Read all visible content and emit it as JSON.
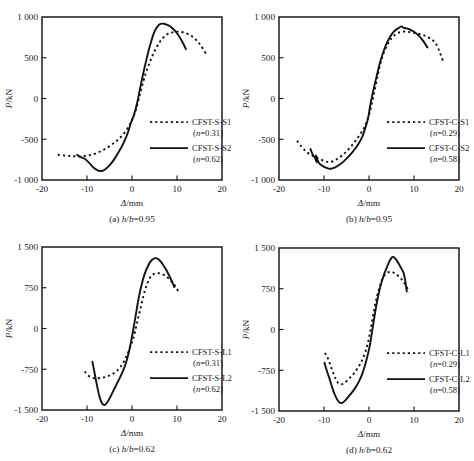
{
  "figure": {
    "panel_count": 4,
    "bottom_caption": ""
  },
  "axes": {
    "xlabel": "Δ/mm",
    "ylabel": "P/kN",
    "xticks": [
      "-20",
      "-10",
      "0",
      "10",
      "20"
    ],
    "xtick_values": [
      -20,
      -10,
      0,
      10,
      20
    ],
    "yticks_top": [
      "1 000",
      "500",
      "0",
      "-500",
      "-1 000"
    ],
    "ytick_values_top": [
      1000,
      500,
      0,
      -500,
      -1000
    ],
    "yticks_bottom": [
      "1 500",
      "750",
      "0",
      "-750",
      "-1 500"
    ],
    "ytick_values_bottom": [
      1500,
      750,
      0,
      -750,
      -1500
    ]
  },
  "panels": [
    {
      "id": "a",
      "caption_index": "(a)",
      "caption_param": "h/b",
      "caption_value": "0.95",
      "caption_full": "(a)  h/b=0.95",
      "legend": [
        {
          "name": "CFST-S-S1",
          "sub": "(n=0.31)",
          "style": "dashed"
        },
        {
          "name": "CFST-S-S2",
          "sub": "(n=0.62)",
          "style": "solid"
        }
      ]
    },
    {
      "id": "b",
      "caption_index": "(b)",
      "caption_param": "h/b",
      "caption_value": "0.95",
      "caption_full": "(b)  h/b=0.95",
      "legend": [
        {
          "name": "CFST-C-S1",
          "sub": "(n=0.29)",
          "style": "dashed"
        },
        {
          "name": "CFST-C-S2",
          "sub": "(n=0.58)",
          "style": "solid"
        }
      ]
    },
    {
      "id": "c",
      "caption_index": "(c)",
      "caption_param": "h/b",
      "caption_value": "0.62",
      "caption_full": "(c)  h/b=0.62",
      "legend": [
        {
          "name": "CFST-S-L1",
          "sub": "(n=0.31)",
          "style": "dashed"
        },
        {
          "name": "CFST-S-L2",
          "sub": "(n=0.62)",
          "style": "solid"
        }
      ]
    },
    {
      "id": "d",
      "caption_index": "(d)",
      "caption_param": "h/b",
      "caption_value": "0.62",
      "caption_full": "(d)  h/b=0.62",
      "legend": [
        {
          "name": "CFST-C-L1",
          "sub": "(n=0.29)",
          "style": "dashed"
        },
        {
          "name": "CFST-C-L2",
          "sub": "(n=0.58)",
          "style": "solid"
        }
      ]
    }
  ],
  "chart_data": [
    {
      "type": "line",
      "panel": "a",
      "title": "(a) h/b=0.95",
      "xlabel": "Δ/mm",
      "ylabel": "P/kN",
      "xlim": [
        -20,
        20
      ],
      "ylim": [
        -1000,
        1000
      ],
      "grid": false,
      "legend_position": "inside-right",
      "series": [
        {
          "name": "CFST-S-S1",
          "annotation": "(n=0.31)",
          "style": "dashed",
          "x": [
            -16.5,
            -15.0,
            -13.5,
            -12.0,
            -10.5,
            -9.0,
            -7.5,
            -6.0,
            -4.5,
            -3.0,
            -1.5,
            -0.5,
            0.0,
            0.8,
            1.8,
            3.0,
            4.5,
            6.0,
            7.5,
            9.0,
            10.5,
            12.0,
            13.5,
            15.0,
            16.5
          ],
          "y": [
            -690,
            -700,
            -706,
            -712,
            -706,
            -690,
            -660,
            -620,
            -566,
            -500,
            -410,
            -320,
            -260,
            -150,
            60,
            300,
            520,
            680,
            775,
            812,
            820,
            800,
            755,
            672,
            545
          ]
        },
        {
          "name": "CFST-S-S2",
          "annotation": "(n=0.62)",
          "style": "solid",
          "x": [
            -12.2,
            -11.5,
            -10.5,
            -9.5,
            -8.5,
            -7.5,
            -6.8,
            -6.0,
            -5.0,
            -4.0,
            -3.0,
            -2.0,
            -1.0,
            -0.3,
            0.0,
            0.5,
            1.2,
            2.0,
            3.0,
            4.0,
            5.0,
            6.0,
            7.0,
            8.0,
            9.0,
            10.0,
            11.0,
            12.0
          ],
          "y": [
            -690,
            -716,
            -740,
            -790,
            -850,
            -885,
            -890,
            -870,
            -820,
            -750,
            -660,
            -560,
            -430,
            -310,
            -265,
            -190,
            -40,
            180,
            430,
            650,
            820,
            905,
            918,
            900,
            862,
            800,
            715,
            605
          ]
        }
      ]
    },
    {
      "type": "line",
      "panel": "b",
      "title": "(b) h/b=0.95",
      "xlabel": "Δ/mm",
      "ylabel": "P/kN",
      "xlim": [
        -20,
        20
      ],
      "ylim": [
        -1000,
        1000
      ],
      "grid": false,
      "legend_position": "inside-right",
      "series": [
        {
          "name": "CFST-C-S1",
          "annotation": "(n=0.29)",
          "style": "dashed",
          "x": [
            -16.0,
            -15.0,
            -14.0,
            -13.0,
            -12.0,
            -11.0,
            -10.0,
            -9.0,
            -8.0,
            -7.0,
            -6.0,
            -5.0,
            -4.0,
            -3.0,
            -2.0,
            -1.0,
            0.0,
            1.0,
            2.0,
            3.0,
            4.5,
            6.0,
            7.5,
            9.0,
            10.5,
            12.0,
            13.5,
            15.0,
            16.5
          ],
          "y": [
            -520,
            -590,
            -650,
            -690,
            -715,
            -740,
            -765,
            -780,
            -770,
            -740,
            -700,
            -650,
            -590,
            -520,
            -440,
            -350,
            -200,
            30,
            300,
            520,
            700,
            790,
            820,
            815,
            800,
            780,
            740,
            660,
            450
          ]
        },
        {
          "name": "CFST-C-S2",
          "annotation": "(n=0.58)",
          "style": "solid",
          "x": [
            -13.0,
            -12.5,
            -12.0,
            -11.6,
            -11.8,
            -11.4,
            -11.0,
            -10.0,
            -9.0,
            -8.5,
            -7.5,
            -6.5,
            -5.5,
            -4.5,
            -3.5,
            -2.5,
            -1.5,
            -0.8,
            -0.2,
            0.2,
            0.8,
            1.6,
            2.5,
            3.5,
            4.5,
            5.5,
            6.5,
            7.2,
            7.6,
            8.2,
            9.0,
            10.0,
            11.0,
            12.0,
            13.0
          ],
          "y": [
            -620,
            -690,
            -730,
            -780,
            -700,
            -760,
            -800,
            -840,
            -860,
            -862,
            -845,
            -810,
            -765,
            -710,
            -645,
            -570,
            -470,
            -360,
            -240,
            -110,
            60,
            250,
            450,
            620,
            740,
            820,
            862,
            885,
            870,
            862,
            848,
            820,
            775,
            710,
            625
          ]
        }
      ]
    },
    {
      "type": "line",
      "panel": "c",
      "title": "(c) h/b=0.62",
      "xlabel": "Δ/mm",
      "ylabel": "P/kN",
      "xlim": [
        -20,
        20
      ],
      "ylim": [
        -1500,
        1500
      ],
      "grid": false,
      "legend_position": "inside-right",
      "series": [
        {
          "name": "CFST-S-L1",
          "annotation": "(n=0.31)",
          "style": "dashed",
          "x": [
            -10.5,
            -9.8,
            -9.0,
            -8.2,
            -7.4,
            -6.6,
            -5.8,
            -5.0,
            -4.2,
            -3.4,
            -2.6,
            -1.8,
            -1.0,
            -0.3,
            0.3,
            1.0,
            1.8,
            2.6,
            3.4,
            4.2,
            5.0,
            5.8,
            6.6,
            7.4,
            8.2,
            9.0,
            9.8,
            10.4
          ],
          "y": [
            -790,
            -860,
            -900,
            -915,
            -915,
            -905,
            -890,
            -865,
            -830,
            -780,
            -710,
            -610,
            -470,
            -320,
            -180,
            60,
            340,
            620,
            830,
            960,
            1010,
            1020,
            1005,
            970,
            915,
            845,
            760,
            655
          ]
        },
        {
          "name": "CFST-S-L2",
          "annotation": "(n=0.62)",
          "style": "solid",
          "x": [
            -8.8,
            -8.4,
            -8.0,
            -7.6,
            -7.2,
            -6.8,
            -6.4,
            -6.0,
            -5.6,
            -5.0,
            -4.4,
            -3.8,
            -3.2,
            -2.6,
            -2.0,
            -1.4,
            -0.8,
            -0.3,
            0.2,
            0.8,
            1.4,
            2.0,
            2.8,
            3.6,
            4.4,
            5.2,
            5.8,
            6.4,
            7.0,
            7.6,
            8.2,
            8.8,
            9.4
          ],
          "y": [
            -610,
            -780,
            -960,
            -1120,
            -1260,
            -1355,
            -1400,
            -1405,
            -1370,
            -1290,
            -1190,
            -1090,
            -990,
            -890,
            -780,
            -650,
            -470,
            -280,
            -60,
            230,
            520,
            760,
            1000,
            1160,
            1260,
            1295,
            1280,
            1230,
            1160,
            1080,
            985,
            880,
            760
          ]
        }
      ]
    },
    {
      "type": "line",
      "panel": "d",
      "title": "(d) h/b=0.62",
      "xlabel": "Δ/mm",
      "ylabel": "P/kN",
      "xlim": [
        -20,
        20
      ],
      "ylim": [
        -1500,
        1500
      ],
      "grid": false,
      "legend_position": "inside-right",
      "series": [
        {
          "name": "CFST-C-L1",
          "annotation": "(n=0.29)",
          "style": "dashed",
          "x": [
            -9.8,
            -9.2,
            -8.6,
            -8.0,
            -7.4,
            -6.8,
            -6.2,
            -5.6,
            -5.0,
            -4.4,
            -3.8,
            -3.2,
            -2.6,
            -2.0,
            -1.4,
            -0.8,
            -0.2,
            0.4,
            1.0,
            1.8,
            2.6,
            3.4,
            4.2,
            5.0,
            5.8,
            6.6,
            7.4,
            8.2,
            8.9
          ],
          "y": [
            -430,
            -520,
            -650,
            -790,
            -910,
            -990,
            -1010,
            -990,
            -950,
            -900,
            -850,
            -790,
            -720,
            -640,
            -540,
            -410,
            -230,
            20,
            300,
            620,
            850,
            990,
            1050,
            1060,
            1030,
            980,
            910,
            810,
            690
          ]
        },
        {
          "name": "CFST-C-L2",
          "annotation": "(n=0.58)",
          "style": "solid",
          "x": [
            -9.9,
            -9.4,
            -8.8,
            -8.2,
            -7.6,
            -7.0,
            -6.6,
            -6.2,
            -5.8,
            -5.2,
            -4.6,
            -4.0,
            -3.4,
            -2.8,
            -2.2,
            -1.6,
            -1.0,
            -0.5,
            0.0,
            0.5,
            1.1,
            1.8,
            2.5,
            3.2,
            3.9,
            4.5,
            5.0,
            5.4,
            6.0,
            6.6,
            7.2,
            7.8,
            8.4
          ],
          "y": [
            -610,
            -750,
            -900,
            -1060,
            -1200,
            -1300,
            -1340,
            -1355,
            -1345,
            -1300,
            -1240,
            -1180,
            -1115,
            -1040,
            -950,
            -840,
            -690,
            -540,
            -370,
            -140,
            180,
            520,
            780,
            980,
            1130,
            1250,
            1320,
            1335,
            1290,
            1210,
            1120,
            1010,
            700
          ]
        }
      ]
    }
  ]
}
